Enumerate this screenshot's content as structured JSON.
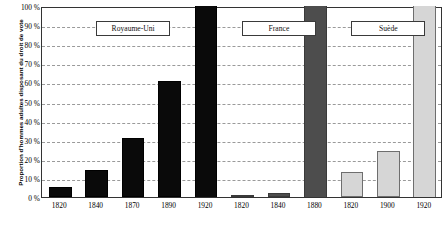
{
  "chart_data": {
    "type": "bar",
    "title": "",
    "xlabel": "",
    "ylabel": "Proportion d'hommes adultes disposant du droit de vote",
    "ylim": [
      0,
      100
    ],
    "grid": true,
    "legend_position": "none",
    "ytick_labels": [
      "0 %",
      "10 %",
      "20 %",
      "30 %",
      "40 %",
      "50 %",
      "60 %",
      "70 %",
      "80 %",
      "90 %",
      "100 %"
    ],
    "ytick_values": [
      0,
      10,
      20,
      30,
      40,
      50,
      60,
      70,
      80,
      90,
      100
    ],
    "categories": [
      "1820",
      "1840",
      "1870",
      "1890",
      "1920",
      "1820",
      "1840",
      "1880",
      "1820",
      "1900",
      "1920"
    ],
    "values": [
      5,
      14,
      31,
      61,
      100,
      1,
      2,
      100,
      13,
      24,
      100
    ],
    "groups": [
      {
        "label": "Royaume-Uni",
        "color": "#0a0a0a",
        "style": "dark",
        "categories": [
          "1820",
          "1840",
          "1870",
          "1890",
          "1920"
        ],
        "values": [
          5,
          14,
          31,
          61,
          100
        ]
      },
      {
        "label": "France",
        "color": "#4d4d4d",
        "style": "mid",
        "categories": [
          "1820",
          "1840",
          "1880"
        ],
        "values": [
          1,
          2,
          100
        ]
      },
      {
        "label": "Suède",
        "color": "#d6d6d6",
        "style": "light",
        "categories": [
          "1820",
          "1900",
          "1920"
        ],
        "values": [
          13,
          24,
          100
        ]
      }
    ]
  },
  "colors": {
    "group_uk": "#0a0a0a",
    "group_france": "#4d4d4d",
    "group_sweden": "#d6d6d6",
    "axis": "#333333",
    "gridline": "#9a9a9a",
    "background": "#ffffff"
  }
}
